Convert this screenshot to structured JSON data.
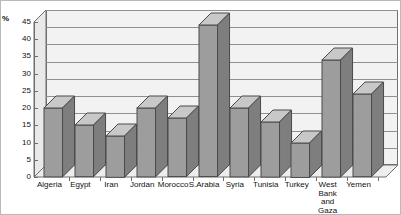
{
  "chart_data": {
    "type": "bar",
    "title": "",
    "subtitle": "",
    "xlabel": "",
    "ylabel": "%",
    "ylim": [
      0,
      45
    ],
    "ytick_step": 5,
    "yticks": [
      "0",
      "5",
      "10",
      "15",
      "20",
      "25",
      "30",
      "35",
      "40",
      "45"
    ],
    "grid": true,
    "legend": "none",
    "style": "3d-column",
    "categories": [
      "Algeria",
      "Egypt",
      "Iran",
      "Jordan",
      "Morocco",
      "S.Arabia",
      "Syria",
      "Tunisia",
      "Turkey",
      "West\nBank\nand\nGaza",
      "Yemen"
    ],
    "values": [
      20,
      15,
      12,
      20,
      17,
      44,
      20,
      16,
      10,
      34,
      24
    ],
    "series": [
      {
        "name": "",
        "values": [
          20,
          15,
          12,
          20,
          17,
          44,
          20,
          16,
          10,
          34,
          24
        ]
      }
    ]
  },
  "colors": {
    "bar_front": "#9d9d9d",
    "bar_top": "#c8c8c8",
    "bar_side": "#7e7e7e",
    "bar_outline": "#4a4a4a",
    "plot_background": "#f2f2f2",
    "grid_line": "#8f8f8f",
    "axis_line": "#6e6e6e",
    "page_background": "#ffffff",
    "border": "#b9b9b9",
    "text": "#111111"
  }
}
